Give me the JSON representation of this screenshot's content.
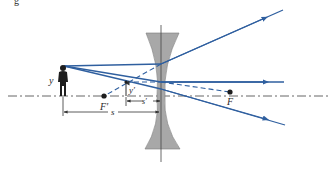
{
  "figure": {
    "caption_fragment": "g",
    "type": "diverging (concave) lens ray diagram",
    "colors": {
      "ray": "#2f5f9f",
      "lens_fill": "#a8a8a8",
      "lens_edge": "#7a7a7a",
      "axis": "#555555",
      "object": "#1e1e1e"
    },
    "labels": {
      "object_height": "y",
      "image_height": "y′",
      "front_focal_point": "F′",
      "back_focal_point": "F",
      "object_distance": "s",
      "image_distance": "s′"
    },
    "elements": {
      "lens": "concave-lens",
      "object": "person-silhouette-icon",
      "image": "upright-virtual-image-arrow",
      "rays": [
        "parallel-ray-diverging-through-F",
        "central-ray-undeviated",
        "ray-toward-F-emerging-parallel"
      ]
    }
  }
}
